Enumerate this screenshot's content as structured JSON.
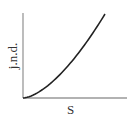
{
  "chart_data": {
    "type": "line",
    "title": "",
    "xlabel": "S",
    "ylabel": "j.n.d.",
    "x_ticks": [],
    "y_ticks": [],
    "grid": false,
    "legend": null,
    "series": [
      {
        "name": "j.n.d. vs S",
        "shape": "concave-up (increasing, accelerating) curve from origin",
        "x": [
          0,
          0.2,
          0.4,
          0.6,
          0.8,
          1.0
        ],
        "values": [
          0,
          0.06,
          0.2,
          0.4,
          0.67,
          1.0
        ]
      }
    ],
    "xlim": [
      0,
      1.25
    ],
    "ylim": [
      0,
      1.0
    ]
  },
  "axes": {
    "color": "#999999",
    "curve_color": "#222222"
  }
}
